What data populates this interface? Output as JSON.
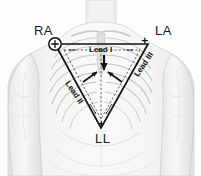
{
  "diagram": {
    "background_color": "#fdfdfd",
    "electrodes": [
      {
        "id": "ra",
        "label": "RA",
        "meaning": "Right Arm",
        "x": 55,
        "y": 44,
        "polarity": "+"
      },
      {
        "id": "la",
        "label": "LA",
        "meaning": "Left Arm",
        "x": 148,
        "y": 44,
        "polarity": "+"
      },
      {
        "id": "ll",
        "label": "LL",
        "meaning": "Left Leg",
        "x": 101,
        "y": 128,
        "polarity": "+"
      }
    ],
    "leads": [
      {
        "id": "lead-1",
        "label": "Lead I",
        "from": "RA",
        "to": "LA",
        "rotation_deg": 0
      },
      {
        "id": "lead-2",
        "label": "Lead II",
        "from": "RA",
        "to": "LL",
        "rotation_deg": 56
      },
      {
        "id": "lead-3",
        "label": "Lead III",
        "from": "LA",
        "to": "LL",
        "rotation_deg": -56
      }
    ],
    "markers": {
      "plus_sign": "+"
    },
    "colors": {
      "triangle_stroke": "#111111",
      "dashed_stroke": "#333333",
      "label_text": "#1a1a1a",
      "lead_text": "#141414",
      "anatomy_light": "#efefef",
      "anatomy_mid": "#dcdcdc",
      "anatomy_dark": "#c4c4c4",
      "anatomy_outline": "#b8b8b8"
    },
    "geometry": {
      "triangle_vertices": [
        [
          55,
          44
        ],
        [
          148,
          44
        ],
        [
          101,
          128
        ]
      ],
      "inner_dashed_vertices": [
        [
          64,
          50
        ],
        [
          140,
          50
        ],
        [
          101,
          119
        ]
      ],
      "centroid": [
        101,
        71
      ]
    }
  }
}
